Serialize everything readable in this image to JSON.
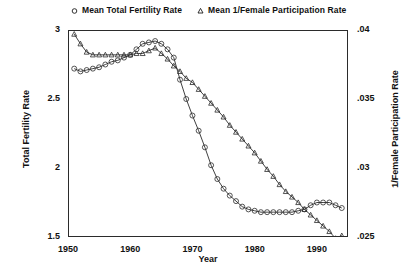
{
  "chart_data": {
    "type": "line",
    "title": "",
    "xlabel": "Year",
    "ylabel": "Total Fertility Rate",
    "ylabel_right": "1/Female Participation Rate",
    "grid": false,
    "legend_position": "top",
    "xlim": [
      1950,
      1995
    ],
    "ylim": [
      1.5,
      3.0
    ],
    "ylim_right": [
      0.025,
      0.04
    ],
    "xticks": [
      "1950",
      "1960",
      "1970",
      "1980",
      "1990"
    ],
    "xtick_values": [
      1950,
      1960,
      1970,
      1980,
      1990
    ],
    "yticks_left": [
      "1.5",
      "2",
      "2.5",
      "3"
    ],
    "ytick_values_left": [
      1.5,
      2,
      2.5,
      3
    ],
    "yticks_right": [
      ".025",
      ".03",
      ".035",
      ".04"
    ],
    "ytick_values_right": [
      0.025,
      0.03,
      0.035,
      0.04
    ],
    "series": [
      {
        "name": "Mean Total Fertility Rate",
        "marker": "circle",
        "axis": "left",
        "color": "#2b2b2b",
        "x": [
          1951,
          1952,
          1953,
          1954,
          1955,
          1956,
          1957,
          1958,
          1959,
          1960,
          1961,
          1962,
          1963,
          1964,
          1965,
          1966,
          1967,
          1968,
          1969,
          1970,
          1971,
          1972,
          1973,
          1974,
          1975,
          1976,
          1977,
          1978,
          1979,
          1980,
          1981,
          1982,
          1983,
          1984,
          1985,
          1986,
          1987,
          1988,
          1989,
          1990,
          1991,
          1992,
          1993,
          1994
        ],
        "y": [
          2.72,
          2.7,
          2.71,
          2.72,
          2.73,
          2.75,
          2.77,
          2.78,
          2.8,
          2.82,
          2.86,
          2.9,
          2.91,
          2.92,
          2.9,
          2.86,
          2.8,
          2.64,
          2.5,
          2.38,
          2.27,
          2.15,
          2.02,
          1.92,
          1.85,
          1.8,
          1.76,
          1.72,
          1.7,
          1.69,
          1.68,
          1.68,
          1.68,
          1.68,
          1.68,
          1.68,
          1.69,
          1.7,
          1.73,
          1.75,
          1.75,
          1.75,
          1.73,
          1.71
        ]
      },
      {
        "name": "Mean 1/Female Participation Rate",
        "marker": "triangle",
        "axis": "right",
        "color": "#2b2b2b",
        "x": [
          1951,
          1952,
          1953,
          1954,
          1955,
          1956,
          1957,
          1958,
          1959,
          1960,
          1961,
          1962,
          1963,
          1964,
          1965,
          1966,
          1967,
          1968,
          1969,
          1970,
          1971,
          1972,
          1973,
          1974,
          1975,
          1976,
          1977,
          1978,
          1979,
          1980,
          1981,
          1982,
          1983,
          1984,
          1985,
          1986,
          1987,
          1988,
          1989,
          1990,
          1991,
          1992,
          1993,
          1994
        ],
        "y": [
          0.0397,
          0.039,
          0.0384,
          0.0382,
          0.0382,
          0.0382,
          0.0382,
          0.0382,
          0.0382,
          0.0382,
          0.0383,
          0.0383,
          0.0385,
          0.0387,
          0.0383,
          0.0379,
          0.0374,
          0.037,
          0.0365,
          0.0362,
          0.0357,
          0.0352,
          0.0347,
          0.0342,
          0.0337,
          0.0331,
          0.0326,
          0.0321,
          0.0316,
          0.0311,
          0.0305,
          0.0299,
          0.0294,
          0.0288,
          0.0283,
          0.0279,
          0.0275,
          0.027,
          0.0266,
          0.0262,
          0.0258,
          0.0254,
          0.0249,
          0.0251
        ]
      }
    ]
  },
  "legend": {
    "entries": [
      {
        "label": "Mean Total Fertility Rate",
        "marker": "circle-marker-icon"
      },
      {
        "label": "Mean 1/Female Participation Rate",
        "marker": "triangle-marker-icon"
      }
    ]
  },
  "axes": {
    "x_title": "Year",
    "y_left_title": "Total Fertility Rate",
    "y_right_title": "1/Female Participation Rate"
  }
}
